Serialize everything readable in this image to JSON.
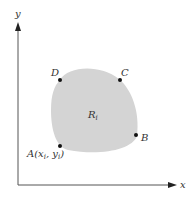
{
  "diagram": {
    "axes": {
      "x_label": "x",
      "y_label": "y",
      "axis_color": "#555555"
    },
    "region": {
      "label": "R",
      "label_subscript": "i",
      "fill": "#d4d4d4"
    },
    "points": [
      {
        "name": "A",
        "label": "A(x",
        "sub1": "i",
        "mid": ", y",
        "sub2": "i",
        "end": ")",
        "x": 60,
        "y": 146
      },
      {
        "name": "B",
        "label": "B",
        "x": 136,
        "y": 136
      },
      {
        "name": "C",
        "label": "C",
        "x": 119,
        "y": 80
      },
      {
        "name": "D",
        "label": "D",
        "x": 60,
        "y": 80
      }
    ]
  }
}
